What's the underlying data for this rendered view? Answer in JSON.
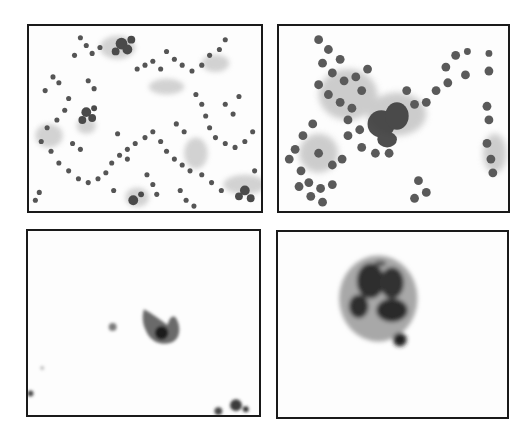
{
  "figure": {
    "layout": "2x2 grid of cytology micrographs (grayscale)",
    "panels": [
      {
        "position": "top-left",
        "content": "low-power field, scattered small round cells in clusters and chains"
      },
      {
        "position": "top-right",
        "content": "medium-power field, sheet of round cells with a dark cell cluster"
      },
      {
        "position": "bottom-left",
        "content": "isolated single atypical cell with eccentric dark nucleus, sparse background"
      },
      {
        "position": "bottom-right",
        "content": "small multinucleated cell cluster with adjacent single small dark cell"
      }
    ]
  },
  "colors": {
    "frame": "#1a1a1a",
    "background": "#ffffff",
    "cell_dark": "#3a3a3a",
    "cell_mid": "#6a6a6a",
    "cytoplasm": "#b8b8b8"
  }
}
